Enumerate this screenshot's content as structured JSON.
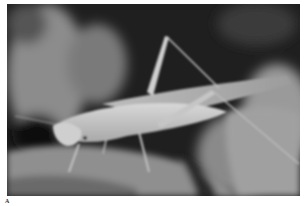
{
  "figure": {
    "panel_label": "A",
    "image_description": "Grayscale close-up photograph of a long-legged grasshopper (katydid-like insect) perched on a fuzzy leaf against a dark blurred background",
    "colors": {
      "background_dark": "#1e1e1e",
      "blur_light": "#9a9a9a",
      "insect_body": "#c8c8c8",
      "leaf": "#8a8a8a"
    }
  }
}
